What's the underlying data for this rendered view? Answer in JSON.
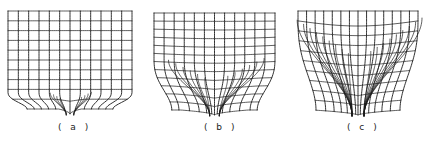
{
  "figure": {
    "background": "#ffffff",
    "line_color": "#1a1a1a",
    "panels": [
      {
        "id": "a",
        "label": "( a )",
        "box": {
          "x": 8,
          "y": 11,
          "w": 124,
          "h": 98
        },
        "label_pos": {
          "x": 58,
          "y": 122
        },
        "cols": 12,
        "rows": 10,
        "funnel_depth": 0.18,
        "funnel_width": 0.22,
        "outlet_x": 0.5,
        "outlet_width": 0.06,
        "description": "Nearly uniform grid with localized convergence near bottom outlet"
      },
      {
        "id": "b",
        "label": "( b )",
        "box": {
          "x": 154,
          "y": 13,
          "w": 121,
          "h": 97
        },
        "label_pos": {
          "x": 204,
          "y": 122
        },
        "cols": 12,
        "rows": 12,
        "funnel_depth": 0.55,
        "funnel_width": 0.75,
        "outlet_x": 0.5,
        "outlet_width": 0.08,
        "description": "Grid with funnel-shaped convergence toward bottom outlet"
      },
      {
        "id": "c",
        "label": "( c )",
        "box": {
          "x": 298,
          "y": 11,
          "w": 120,
          "h": 99
        },
        "label_pos": {
          "x": 347,
          "y": 122
        },
        "cols": 14,
        "rows": 10,
        "funnel_depth": 0.95,
        "funnel_width": 1.0,
        "outlet_x": 0.5,
        "outlet_width": 0.1,
        "description": "Strongly distorted grid with flow lines converging from top corners to bottom outlet"
      }
    ]
  }
}
